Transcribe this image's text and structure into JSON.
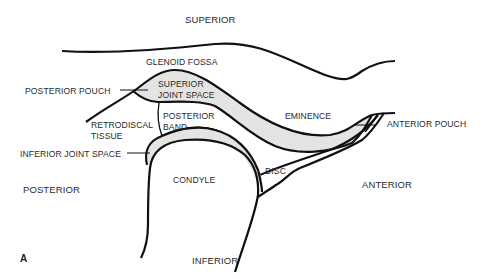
{
  "diagram": {
    "type": "anatomical-line-drawing",
    "panel_label": "A",
    "colors": {
      "stroke": "#111111",
      "joint_space_fill": "#e4e4e4",
      "background": "#ffffff",
      "text": "#2a2a2a"
    },
    "orientation": {
      "top": "SUPERIOR",
      "bottom": "INFERIOR",
      "left": "POSTERIOR",
      "right": "ANTERIOR"
    },
    "labels": {
      "glenoid_fossa": "GLENOID FOSSA",
      "posterior_pouch": "POSTERIOR POUCH",
      "superior_joint_space_1": "SUPERIOR",
      "superior_joint_space_2": "JOINT SPACE",
      "retrodiscal_1": "RETRODISCAL",
      "retrodiscal_2": "TISSUE",
      "posterior_band_1": "POSTERIOR",
      "posterior_band_2": "BAND",
      "eminence": "EMINENCE",
      "anterior_pouch": "ANTERIOR POUCH",
      "inferior_joint_space": "INFERIOR JOINT SPACE",
      "condyle": "CONDYLE",
      "disc": "DISC"
    }
  }
}
